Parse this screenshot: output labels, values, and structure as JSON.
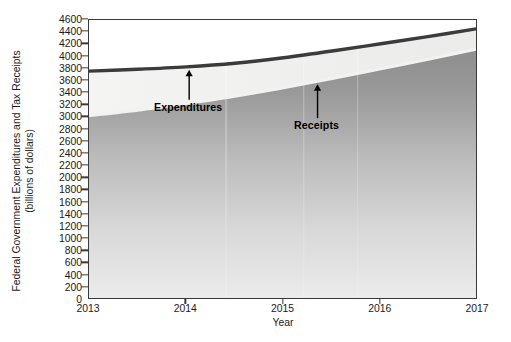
{
  "chart_data": {
    "type": "area",
    "title": "",
    "xlabel": "Year",
    "ylabel": "Federal Government Expenditures and Tax Receipts (billions of dollars)",
    "ylabel_line1": "Federal Government Expenditures and Tax Receipts",
    "ylabel_line2": "(billions of dollars)",
    "xlim": [
      2013,
      2017
    ],
    "ylim": [
      0,
      4600
    ],
    "grid": false,
    "legend_position": "none",
    "yticks": [
      0,
      200,
      400,
      600,
      800,
      1000,
      1200,
      1400,
      1600,
      1800,
      2000,
      2200,
      2400,
      2600,
      2800,
      3000,
      3200,
      3400,
      3600,
      3800,
      4000,
      4200,
      4400,
      4600
    ],
    "ytick_labels": [
      "0",
      "200",
      "400",
      "600",
      "800",
      "1000",
      "1200",
      "1400",
      "1600",
      "1800",
      "2000",
      "2200",
      "2400",
      "2600",
      "2800",
      "3000",
      "3200",
      "3400",
      "3600",
      "3800",
      "4000",
      "4200",
      "4400",
      "4600"
    ],
    "xticks": [
      2013,
      2014,
      2015,
      2016,
      2017
    ],
    "xtick_labels": [
      "2013",
      "2014",
      "2015",
      "2016",
      "2017"
    ],
    "x": [
      2013,
      2013.5,
      2014,
      2014.5,
      2015,
      2015.5,
      2016,
      2016.5,
      2017
    ],
    "series": [
      {
        "name": "Expenditures",
        "color": "#3a3a3a",
        "values": [
          3760,
          3790,
          3830,
          3890,
          3980,
          4090,
          4210,
          4330,
          4460
        ]
      },
      {
        "name": "Receipts",
        "color": "#f0f0ee",
        "values": [
          3030,
          3120,
          3230,
          3350,
          3490,
          3640,
          3800,
          3960,
          4130
        ]
      }
    ],
    "annotations": [
      {
        "label": "Expenditures",
        "series": "Expenditures",
        "x": 2014.03,
        "arrow": "up"
      },
      {
        "label": "Receipts",
        "series": "Receipts",
        "x": 2015.35,
        "arrow": "up"
      }
    ]
  },
  "colors": {
    "axis": "#3a3a3a",
    "text": "#1b1b1b",
    "expenditures_line": "#3a3a3a",
    "receipts_line": "#f0f0ee",
    "fill_top": "#939393",
    "fill_bottom": "#e2e2e2",
    "band_fill": "#f2f2f0",
    "plot_background": "#ffffff",
    "page_background": "#ffffff"
  }
}
